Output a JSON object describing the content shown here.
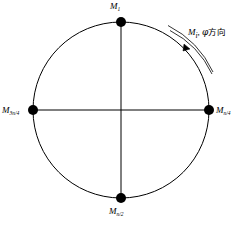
{
  "figure": {
    "type": "circle-node-diagram",
    "background_color": "#ffffff",
    "stroke_color": "#000000",
    "node_fill_color": "#000000"
  },
  "geometry": {
    "circle": {
      "cx": 121,
      "cy": 110,
      "r": 88
    },
    "arrow_arc": {
      "cx": 121,
      "cy": 110,
      "r_outer": 99,
      "r_inner": 94
    },
    "nodes": [
      {
        "key": "top",
        "cx": 121,
        "cy": 22,
        "r": 5
      },
      {
        "key": "right",
        "cx": 209,
        "cy": 110,
        "r": 5
      },
      {
        "key": "bottom",
        "cx": 121,
        "cy": 198,
        "r": 5
      },
      {
        "key": "left",
        "cx": 33,
        "cy": 110,
        "r": 5
      }
    ]
  },
  "labels": {
    "top": {
      "symbol": "M",
      "subscript": "1"
    },
    "right": {
      "symbol": "M",
      "subscript": "n/4"
    },
    "bottom": {
      "symbol": "M",
      "subscript": "n/2"
    },
    "left": {
      "symbol": "M",
      "subscript": "3n/4"
    }
  },
  "annotation": {
    "symbol": "M",
    "subscript": "i",
    "separator": ", ",
    "phi": "φ",
    "direction_text": "方向",
    "full_text": "M i , φ方向"
  }
}
